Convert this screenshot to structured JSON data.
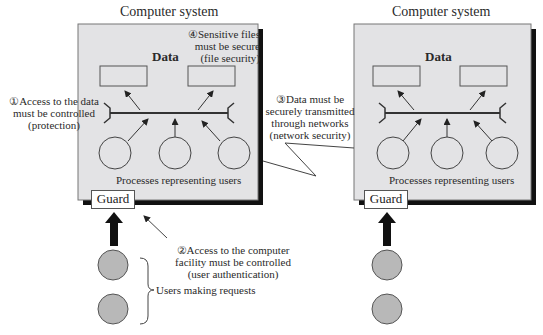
{
  "systems": [
    {
      "title": "Computer system",
      "data_label": "Data",
      "processes_label": "Processes representing users",
      "guard_label": "Guard"
    },
    {
      "title": "Computer system",
      "data_label": "Data",
      "processes_label": "Processes representing users",
      "guard_label": "Guard"
    }
  ],
  "annotations": {
    "a1": {
      "marker": "①",
      "lines": [
        "Access to the data",
        "must be controlled",
        "(protection)"
      ]
    },
    "a2": {
      "marker": "②",
      "lines": [
        "Access to the computer",
        "facility must be controlled",
        "(user authentication)"
      ]
    },
    "a3": {
      "marker": "③",
      "lines": [
        "Data must be",
        "securely transmitted",
        "through networks",
        "(network security)"
      ]
    },
    "a4": {
      "marker": "④",
      "lines": [
        "Sensitive files",
        "must be secure",
        "(file security)"
      ]
    }
  },
  "users_label": "Users making requests",
  "colors": {
    "box_fill": "#e3e3e5",
    "shadow": "#111111",
    "user_fill": "#b8b8b8",
    "line": "#333333"
  }
}
